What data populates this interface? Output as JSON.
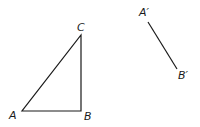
{
  "diagram": {
    "triangle": {
      "vertices": [
        {
          "label": "A",
          "x": 22,
          "y": 111,
          "label_x": 9,
          "label_y": 119
        },
        {
          "label": "B",
          "x": 81,
          "y": 111,
          "label_x": 84,
          "label_y": 120
        },
        {
          "label": "C",
          "x": 81,
          "y": 35,
          "label_x": 77,
          "label_y": 31
        }
      ]
    },
    "segment": {
      "endpoints": [
        {
          "label": "A′",
          "x": 148,
          "y": 22,
          "label_x": 139,
          "label_y": 16
        },
        {
          "label": "B′",
          "x": 177,
          "y": 69,
          "label_x": 178,
          "label_y": 79
        }
      ]
    },
    "stroke_color": "#1a1a1a",
    "background": "#ffffff"
  }
}
